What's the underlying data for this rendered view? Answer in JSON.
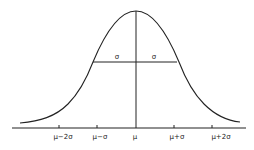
{
  "diagram": {
    "center_label": "μ",
    "sigma_labels": [
      "σ",
      "σ"
    ],
    "x_ticks": [
      {
        "label": "μ−2σ",
        "x": 59
      },
      {
        "label": "μ−σ",
        "x": 97
      },
      {
        "label": "μ",
        "x": 136
      },
      {
        "label": "μ+σ",
        "x": 174
      },
      {
        "label": "μ+2σ",
        "x": 212
      }
    ],
    "colors": {
      "line": "#222222",
      "background": "#ffffff"
    }
  }
}
